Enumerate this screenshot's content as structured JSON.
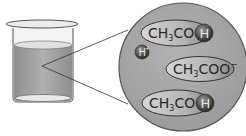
{
  "diagram": {
    "beaker": {
      "label": "beaker of solution"
    },
    "zoom_circle": {
      "molecules": [
        {
          "main": "CH",
          "sub": "3",
          "rest": "COO",
          "ion": "H",
          "kind": "CH3COOH"
        },
        {
          "main": "CH",
          "sub": "3",
          "rest": "COO",
          "sup": "−",
          "kind": "CH3COO-"
        },
        {
          "main": "CH",
          "sub": "3",
          "rest": "COO",
          "ion": "H",
          "kind": "CH3COOH"
        }
      ],
      "free_ion": {
        "label": "H",
        "sup": "+",
        "kind": "H+"
      }
    },
    "colors": {
      "liquid": "#a9a9a9",
      "circle": "#a3a3a3",
      "ellipse": "#bdbdbd",
      "ion": "#555555"
    }
  }
}
